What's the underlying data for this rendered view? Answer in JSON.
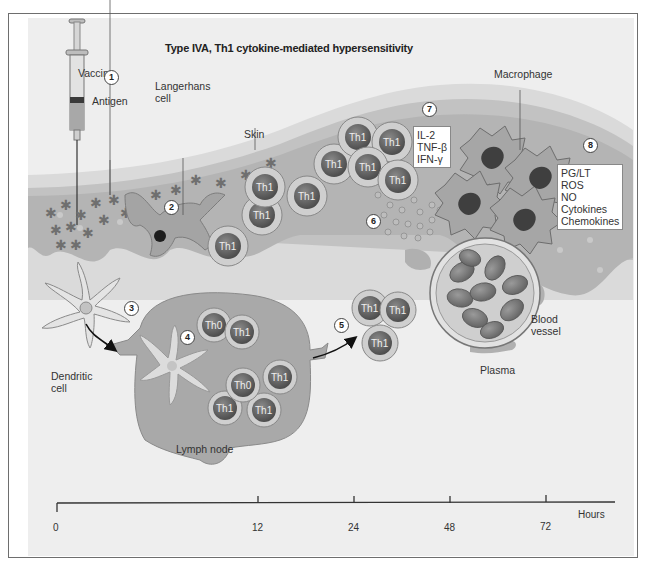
{
  "title": "Type IVA, Th1 cytokine-mediated hypersensitivity",
  "labels": {
    "vaccine": "Vaccine",
    "antigen": "Antigen",
    "langerhans_line1": "Langerhans",
    "langerhans_line2": "cell",
    "skin": "Skin",
    "macrophage": "Macrophage",
    "dendritic_line1": "Dendritic",
    "dendritic_line2": "cell",
    "lymph_node": "Lymph node",
    "blood_line1": "Blood",
    "blood_line2": "vessel",
    "plasma": "Plasma"
  },
  "steps": [
    "1",
    "2",
    "3",
    "4",
    "5",
    "6",
    "7",
    "8"
  ],
  "cytokine_box": [
    "IL-2",
    "TNF-β",
    "IFN-γ"
  ],
  "mediator_box": [
    "PG/LT",
    "ROS",
    "NO",
    "Cytokines",
    "Chemokines"
  ],
  "cells": {
    "th1": "Th1",
    "th0": "Th0"
  },
  "timeline": {
    "unit": "Hours",
    "ticks": [
      "0",
      "12",
      "24",
      "48",
      "72"
    ]
  },
  "colors": {
    "panel": "#eeeeee",
    "skin_outer": "#cfcfcf",
    "dermis": "#b5b5b5",
    "cell_nucleus": "#6a6a6a",
    "cell_body": "#c9c9c9",
    "lymph": "#a9a9a9",
    "antigen": "#6f6f6f"
  }
}
